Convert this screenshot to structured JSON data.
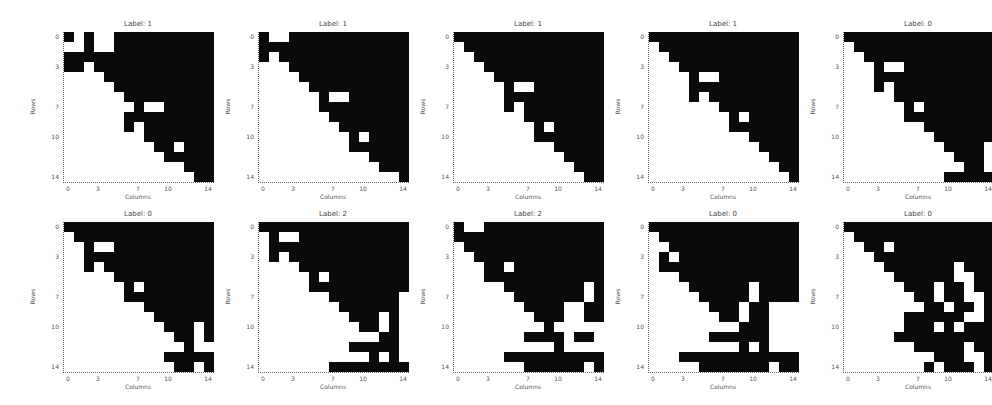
{
  "chart_data": {
    "type": "heatmap",
    "layout": {
      "rows": 2,
      "cols": 5
    },
    "grid_size": [
      15,
      15
    ],
    "colormap": {
      "1": "#0a0a0a",
      "0": "#ffffff"
    },
    "xlabel": "Columns",
    "ylabel": "Rows",
    "xticks": [
      "0",
      "3",
      "7",
      "10",
      "14"
    ],
    "yticks": [
      "0",
      "3",
      "7",
      "10",
      "14"
    ],
    "panels": [
      {
        "title": "Label: 1",
        "matrix": [
          "101001111111111",
          "001001111111111",
          "111111111111111",
          "110111111111111",
          "000011111111111",
          "000001111111111",
          "000000111111111",
          "000000010011111",
          "000000111111111",
          "000000101111111",
          "000000001111111",
          "000000000110111",
          "000000000011111",
          "000000000000111",
          "000000000000011"
        ]
      },
      {
        "title": "Label: 1",
        "matrix": [
          "100111111111111",
          "111111111111111",
          "101111111111111",
          "000111111111111",
          "000011111111111",
          "000001111111111",
          "000000100111111",
          "000000111111111",
          "000000011111111",
          "000000001111111",
          "000000000101111",
          "000000000111111",
          "000000000001111",
          "000000000000111",
          "000000000000001"
        ]
      },
      {
        "title": "Label: 1",
        "matrix": [
          "111111111111111",
          "011111111111111",
          "001111111111111",
          "000111111111111",
          "000011111111111",
          "000001001111111",
          "000001111111111",
          "000001011111111",
          "000000011111111",
          "000000001011111",
          "000000001111111",
          "000000000011111",
          "000000000001111",
          "000000000000111",
          "000000000000011"
        ]
      },
      {
        "title": "Label: 1",
        "matrix": [
          "111111111111111",
          "011111111111111",
          "001111111111111",
          "000111111111111",
          "000010011111111",
          "000011111111111",
          "000010111111111",
          "000000011111111",
          "000000001011111",
          "000000001111111",
          "000000000011111",
          "000000000001111",
          "000000000000111",
          "000000000000011",
          "000000000000001"
        ]
      },
      {
        "title": "Label: 0",
        "matrix": [
          "111111111111111",
          "011111111111111",
          "001111111111111",
          "000100111111111",
          "000111111111111",
          "000101111111111",
          "000001111111111",
          "000000101111111",
          "000000111111111",
          "000000001111111",
          "000000000111111",
          "000000000011110",
          "000000000001110",
          "000000000000110",
          "000000000011111"
        ]
      },
      {
        "title": "Label: 0",
        "matrix": [
          "111111111111111",
          "011111111111111",
          "001001111111111",
          "001111111111111",
          "001011111111111",
          "000001111111111",
          "000000101111111",
          "000000111111111",
          "000000001111111",
          "000000000111111",
          "000000000011101",
          "000000000001101",
          "000000000000100",
          "000000000011111",
          "000000000001101"
        ]
      },
      {
        "title": "Label: 2",
        "matrix": [
          "111111111111111",
          "010011111111111",
          "011111111111111",
          "010111111111111",
          "000011111111111",
          "000001011111111",
          "000001111111111",
          "000000011111110",
          "000000001111110",
          "000000000111010",
          "000000000011010",
          "000000000000110",
          "000000000111110",
          "000000000001010",
          "000000011111111"
        ]
      },
      {
        "title": "Label: 2",
        "matrix": [
          "100111111111111",
          "111111111111111",
          "011111111111111",
          "001111111111111",
          "000110111111111",
          "000111111111111",
          "000001111111101",
          "000000111111101",
          "000000011110011",
          "000000001110011",
          "000000000100000",
          "000000011110110",
          "000000000010000",
          "000001111111111",
          "000000011111101"
        ]
      },
      {
        "title": "Label: 0",
        "matrix": [
          "111111111111111",
          "011111111111111",
          "001111111111111",
          "010111111111111",
          "011111111111111",
          "000111111111111",
          "000011111101111",
          "000001111101111",
          "000000111011000",
          "000000011011000",
          "000000000111000",
          "000000111111000",
          "000000000101000",
          "000111111111111",
          "000001111111011"
        ]
      },
      {
        "title": "Label: 0",
        "matrix": [
          "111111111111111",
          "011111111111111",
          "001101111111111",
          "000111111111111",
          "000011111110111",
          "000001111110011",
          "000000111011011",
          "000000011011001",
          "000000001101101",
          "000000111111001",
          "000000111010111",
          "000001111111111",
          "000000011111011",
          "000000000111001",
          "000000001011101"
        ]
      }
    ]
  }
}
